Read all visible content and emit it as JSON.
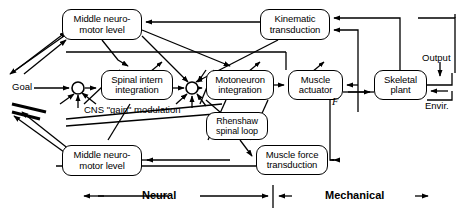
{
  "diagram": {
    "stroke_color": "#000000",
    "background_color": "#ffffff",
    "blocks": [
      {
        "id": "middle_upper",
        "label_line1": "Middle neuro-",
        "label_line2": "motor level",
        "x": 62,
        "y": 9,
        "w": 80,
        "h": 31
      },
      {
        "id": "kinematic",
        "label_line1": "Kinematic",
        "label_line2": "transduction",
        "x": 260,
        "y": 9,
        "w": 70,
        "h": 31
      },
      {
        "id": "spinal_intern",
        "label_line1": "Spinal intern",
        "label_line2": "integration",
        "x": 101,
        "y": 70,
        "w": 72,
        "h": 30
      },
      {
        "id": "motoneuron",
        "label_line1": "Motoneuron",
        "label_line2": "integration",
        "x": 206,
        "y": 70,
        "w": 68,
        "h": 30
      },
      {
        "id": "muscle_actuator",
        "label_line1": "Muscle",
        "label_line2": "actuator",
        "x": 288,
        "y": 70,
        "w": 55,
        "h": 30
      },
      {
        "id": "skeletal_plant",
        "label_line1": "Skeletal",
        "label_line2": "plant",
        "x": 374,
        "y": 70,
        "w": 53,
        "h": 30
      },
      {
        "id": "renshaw_loop",
        "label_line1": "Rhenshaw",
        "label_line2": "spinal loop",
        "x": 206,
        "y": 112,
        "w": 62,
        "h": 28
      },
      {
        "id": "muscle_force",
        "label_line1": "Muscle force",
        "label_line2": "transduction",
        "x": 256,
        "y": 145,
        "w": 72,
        "h": 30
      },
      {
        "id": "middle_lower",
        "label_line1": "Middle neuro-",
        "label_line2": "motor level",
        "x": 62,
        "y": 145,
        "w": 80,
        "h": 31
      }
    ],
    "junctions": [
      {
        "id": "sum1",
        "cx": 78,
        "cy": 88,
        "r": 6
      },
      {
        "id": "sum2",
        "cx": 192,
        "cy": 88,
        "r": 6
      }
    ],
    "free_labels": [
      {
        "id": "goal",
        "text": "Goal",
        "x": 12,
        "y": 81
      },
      {
        "id": "cns_gain",
        "text": "CNS \"gain\" modulation",
        "x": 84,
        "y": 110
      },
      {
        "id": "output",
        "text": "Output",
        "x": 424,
        "y": 60
      },
      {
        "id": "envir",
        "text": "Envir.",
        "x": 427,
        "y": 96
      },
      {
        "id": "force",
        "text": "F",
        "x": 328,
        "y": 96
      }
    ],
    "axis": {
      "neural_label": "Neural",
      "mechanical_label": "Mechanical",
      "divider_x": 273,
      "baseline_y": 196
    }
  }
}
